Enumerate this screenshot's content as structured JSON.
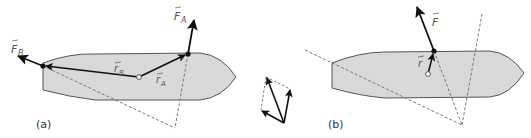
{
  "diagram": {
    "panels": [
      {
        "id": "a",
        "label": "(a)",
        "vectors": {
          "force_a": "F",
          "force_a_sub": "A",
          "force_b": "F",
          "force_b_sub": "B",
          "radius_a": "r",
          "radius_a_sub": "A",
          "radius_b": "r",
          "radius_b_sub": "B"
        }
      },
      {
        "id": "b",
        "label": "(b)",
        "vectors": {
          "force": "F",
          "radius": "r"
        }
      }
    ],
    "middle": "vector-addition-parallelogram",
    "colors": {
      "hull_fill": "#d9d9d9",
      "hull_stroke": "#555555",
      "vector": "#111111",
      "dashed": "#777777"
    }
  }
}
